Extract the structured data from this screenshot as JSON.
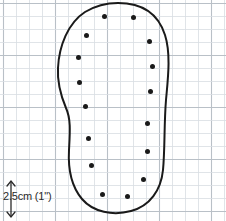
{
  "figure": {
    "background_color": "#ffffff"
  },
  "grid": {
    "minor_spacing_px": 13,
    "major_every": 4,
    "minor_color": "#d8dde2",
    "major_color": "#b9c0c7",
    "origin_x_px": 3,
    "origin_y_px": 3
  },
  "outline": {
    "name": "foot-outline",
    "stroke_color": "#1a1a1a",
    "stroke_width_px": 2,
    "fill": "none",
    "bounds": {
      "x_min": 58,
      "x_max": 167,
      "y_min": 3,
      "y_max": 213
    }
  },
  "dots": {
    "color": "#1a1a1a",
    "radius_px": 2.5,
    "count": 16,
    "points": [
      {
        "label": "toe-left",
        "x": 104,
        "y": 16
      },
      {
        "label": "toe-right",
        "x": 133,
        "y": 17
      },
      {
        "label": "left-1",
        "x": 86,
        "y": 35
      },
      {
        "label": "right-1",
        "x": 149,
        "y": 41
      },
      {
        "label": "left-2",
        "x": 78,
        "y": 57
      },
      {
        "label": "right-2",
        "x": 152,
        "y": 66
      },
      {
        "label": "left-3",
        "x": 79,
        "y": 82
      },
      {
        "label": "right-3",
        "x": 150,
        "y": 91
      },
      {
        "label": "left-4",
        "x": 85,
        "y": 106
      },
      {
        "label": "right-4",
        "x": 147,
        "y": 123
      },
      {
        "label": "left-5",
        "x": 88,
        "y": 138
      },
      {
        "label": "right-5",
        "x": 147,
        "y": 151
      },
      {
        "label": "left-6",
        "x": 91,
        "y": 165
      },
      {
        "label": "right-6",
        "x": 143,
        "y": 179
      },
      {
        "label": "heel-left",
        "x": 102,
        "y": 194
      },
      {
        "label": "heel-right",
        "x": 127,
        "y": 196
      }
    ]
  },
  "scale": {
    "label": "2.5cm (1\")",
    "arrow_name": "vertical-double-arrow",
    "arrow_color": "#2a2a2a",
    "arrow_x_px": 11,
    "arrow_top_px": 181,
    "arrow_bottom_px": 217
  }
}
